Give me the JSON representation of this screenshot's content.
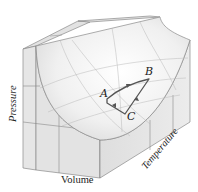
{
  "figure": {
    "type": "PVT surface diagram",
    "axes": {
      "x_label": "Volume",
      "y_label": "Pressure",
      "z_label": "Temperature"
    },
    "points": [
      {
        "name": "A",
        "label": "A"
      },
      {
        "name": "B",
        "label": "B"
      },
      {
        "name": "C",
        "label": "C"
      }
    ],
    "cycle": "A → B → C → A",
    "colors": {
      "box_face": "#e4e4e4",
      "box_edge": "#8a8a8a",
      "surface_light": "#fbfbfb",
      "surface_shade": "#d9d9d9",
      "cycle_path": "#555555"
    }
  }
}
